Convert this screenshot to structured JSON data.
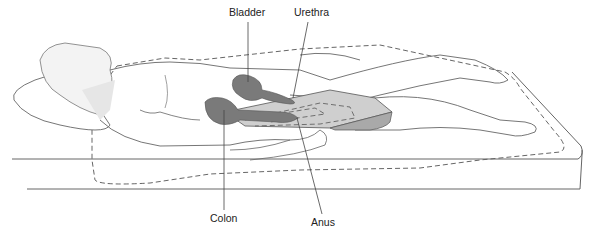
{
  "diagram": {
    "labels": {
      "bladder": "Bladder",
      "urethra": "Urethra",
      "colon": "Colon",
      "anus": "Anus"
    },
    "colors": {
      "line": "#555555",
      "organ_dark": "#7a7a7a",
      "pad_light": "#cfcfcf",
      "pad_shadow": "#a9a9a9",
      "background": "#ffffff"
    }
  }
}
